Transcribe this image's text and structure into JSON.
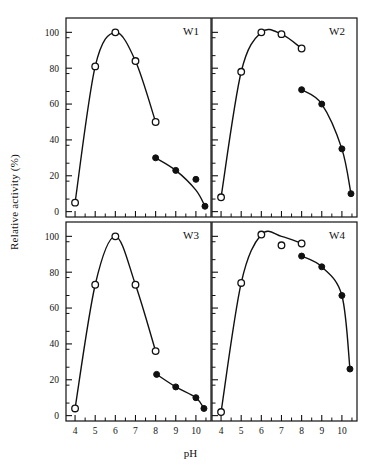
{
  "figure": {
    "xlabel": "pH",
    "ylabel": "Relative activity (%)",
    "x_ticks": [
      4,
      5,
      6,
      7,
      8,
      9,
      10
    ],
    "y_ticks": [
      0,
      20,
      40,
      60,
      80,
      100
    ],
    "x_minor_step": 0.5,
    "y_minor_step": 10,
    "xlim": [
      3.55,
      10.75
    ],
    "ylim": [
      -3,
      108
    ],
    "grid": false,
    "legend": null,
    "marker_open": "open-circle",
    "marker_filled": "filled-circle",
    "line_color": "#111111",
    "axis_color": "#111111",
    "background": "#ffffff"
  },
  "panels": [
    {
      "id": "W1",
      "label": "W1",
      "row": 0,
      "col": 0
    },
    {
      "id": "W2",
      "label": "W2",
      "row": 0,
      "col": 1
    },
    {
      "id": "W3",
      "label": "W3",
      "row": 1,
      "col": 0
    },
    {
      "id": "W4",
      "label": "W4",
      "row": 1,
      "col": 1
    }
  ],
  "chart_data": {
    "type": "line",
    "title": "",
    "xlabel": "pH",
    "ylabel": "Relative activity (%)",
    "xlim": [
      3.55,
      10.75
    ],
    "ylim": [
      -3,
      108
    ],
    "xticks": [
      4,
      5,
      6,
      7,
      8,
      9,
      10
    ],
    "yticks": [
      0,
      20,
      40,
      60,
      80,
      100
    ],
    "grid": false,
    "legend_position": "none",
    "panels": [
      {
        "name": "W1",
        "series": [
          {
            "name": "open-circle",
            "marker": "open-circle",
            "x": [
              4.0,
              5.0,
              6.0,
              7.0,
              8.0
            ],
            "values": [
              5,
              81,
              100,
              84,
              50
            ]
          },
          {
            "name": "filled-circle",
            "marker": "filled-circle",
            "x": [
              8.0,
              9.0,
              10.0,
              10.45
            ],
            "values": [
              30,
              23,
              18,
              3
            ]
          }
        ]
      },
      {
        "name": "W2",
        "series": [
          {
            "name": "open-circle",
            "marker": "open-circle",
            "x": [
              4.0,
              5.0,
              6.0,
              7.0,
              8.0
            ],
            "values": [
              8,
              78,
              100,
              99,
              91
            ]
          },
          {
            "name": "filled-circle",
            "marker": "filled-circle",
            "x": [
              8.0,
              9.0,
              10.0,
              10.45
            ],
            "values": [
              68,
              60,
              35,
              10
            ]
          }
        ]
      },
      {
        "name": "W3",
        "series": [
          {
            "name": "open-circle",
            "marker": "open-circle",
            "x": [
              4.0,
              5.0,
              6.0,
              7.0,
              8.0
            ],
            "values": [
              4,
              73,
              100,
              73,
              36
            ]
          },
          {
            "name": "filled-circle",
            "marker": "filled-circle",
            "x": [
              8.05,
              9.0,
              10.0,
              10.4
            ],
            "values": [
              23,
              16,
              10,
              4
            ]
          }
        ]
      },
      {
        "name": "W4",
        "series": [
          {
            "name": "open-circle",
            "marker": "open-circle",
            "x": [
              4.0,
              5.0,
              6.0,
              7.0,
              8.0
            ],
            "values": [
              2,
              74,
              101,
              95,
              96
            ]
          },
          {
            "name": "filled-circle",
            "marker": "filled-circle",
            "x": [
              8.0,
              9.0,
              10.0,
              10.4
            ],
            "values": [
              89,
              83,
              67,
              26
            ]
          }
        ]
      }
    ]
  }
}
